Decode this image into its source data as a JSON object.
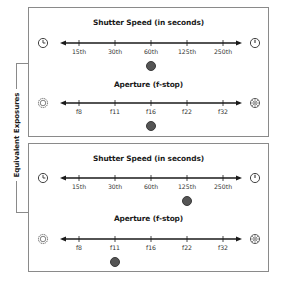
{
  "diagram": {
    "side_label": "Equivalent Exposures",
    "colors": {
      "border": "#8a8a8a",
      "line": "#1a1a1a",
      "dot": "#555555"
    },
    "examples": [
      {
        "shutter": {
          "title": "Shutter Speed (in seconds)",
          "left_icon": "slow-clock-icon",
          "right_icon": "fast-clock-icon",
          "ticks": [
            "15th",
            "30th",
            "60th",
            "125th",
            "250th"
          ],
          "selected_index": 2,
          "selected_value": "60th"
        },
        "aperture": {
          "title": "Aperture (f-stop)",
          "left_icon": "wide-aperture-icon",
          "right_icon": "narrow-aperture-icon",
          "ticks": [
            "f8",
            "f11",
            "f16",
            "f22",
            "f32"
          ],
          "selected_index": 2,
          "selected_value": "f16"
        }
      },
      {
        "shutter": {
          "title": "Shutter Speed (in seconds)",
          "left_icon": "slow-clock-icon",
          "right_icon": "fast-clock-icon",
          "ticks": [
            "15th",
            "30th",
            "60th",
            "125th",
            "250th"
          ],
          "selected_index": 3,
          "selected_value": "125th"
        },
        "aperture": {
          "title": "Aperture (f-stop)",
          "left_icon": "wide-aperture-icon",
          "right_icon": "narrow-aperture-icon",
          "ticks": [
            "f8",
            "f11",
            "f16",
            "f22",
            "f32"
          ],
          "selected_index": 1,
          "selected_value": "f11"
        }
      }
    ]
  }
}
